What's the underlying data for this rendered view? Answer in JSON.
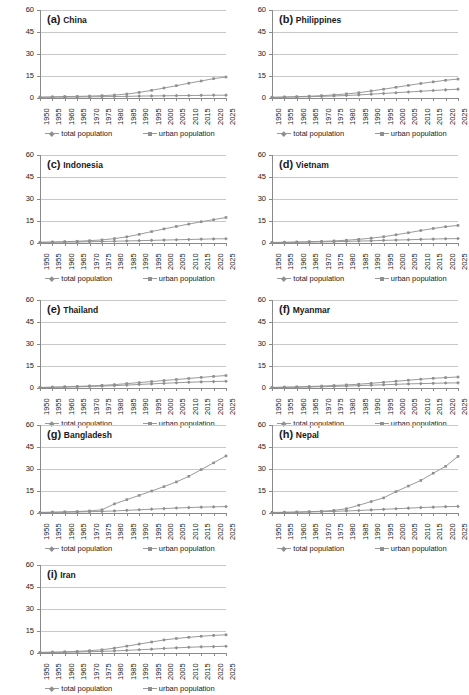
{
  "figure": {
    "panel_count": 9,
    "series_names": [
      "total population",
      "urban population"
    ],
    "legend": {
      "total_label": "total population",
      "urban_label": "urban population"
    },
    "colors": {
      "total_series": "#8f8f8f",
      "urban_series": "#8f8f8f",
      "gridline": "#c8c8c8",
      "axis": "#8a8a8a",
      "background": "#ffffff",
      "text": "#1a1a1a"
    }
  },
  "chart_data": [
    {
      "type": "line",
      "panel_id": "(a)",
      "title": "China",
      "x": [
        1950,
        1955,
        1960,
        1965,
        1970,
        1975,
        1980,
        1985,
        1990,
        1995,
        2000,
        2005,
        2010,
        2015,
        2020,
        2025
      ],
      "xlabel": "",
      "ylabel": "",
      "ylim": [
        0,
        60
      ],
      "yticks": [
        0,
        15,
        30,
        45,
        60
      ],
      "grid": true,
      "legend_position": "bottom",
      "series": [
        {
          "name": "total population",
          "values": [
            0.4,
            0.5,
            0.6,
            0.7,
            0.8,
            0.9,
            1.0,
            1.1,
            1.3,
            1.4,
            1.5,
            1.6,
            1.7,
            1.8,
            1.9,
            1.9
          ]
        },
        {
          "name": "urban population",
          "values": [
            0.6,
            0.8,
            1.0,
            1.1,
            1.3,
            1.6,
            2.0,
            2.7,
            3.8,
            5.2,
            6.8,
            8.4,
            10.1,
            11.6,
            13.2,
            14.3
          ]
        }
      ]
    },
    {
      "type": "line",
      "panel_id": "(b)",
      "title": "Philippines",
      "x": [
        1950,
        1955,
        1960,
        1965,
        1970,
        1975,
        1980,
        1985,
        1990,
        1995,
        2000,
        2005,
        2010,
        2015,
        2020,
        2025
      ],
      "xlabel": "",
      "ylabel": "",
      "ylim": [
        0,
        60
      ],
      "yticks": [
        0,
        15,
        30,
        45,
        60
      ],
      "grid": true,
      "legend_position": "bottom",
      "series": [
        {
          "name": "total population",
          "values": [
            0.4,
            0.5,
            0.7,
            0.9,
            1.1,
            1.4,
            1.7,
            2.1,
            2.6,
            3.1,
            3.6,
            4.1,
            4.6,
            5.1,
            5.6,
            6.0
          ]
        },
        {
          "name": "urban population",
          "values": [
            0.5,
            0.7,
            0.9,
            1.2,
            1.6,
            2.1,
            2.8,
            3.6,
            4.8,
            6.0,
            7.3,
            8.6,
            9.9,
            11.0,
            12.1,
            12.9
          ]
        }
      ]
    },
    {
      "type": "line",
      "panel_id": "(c)",
      "title": "Indonesia",
      "x": [
        1950,
        1955,
        1960,
        1965,
        1970,
        1975,
        1980,
        1985,
        1990,
        1995,
        2000,
        2005,
        2010,
        2015,
        2020,
        2025
      ],
      "xlabel": "",
      "ylabel": "",
      "ylim": [
        0,
        60
      ],
      "yticks": [
        0,
        15,
        30,
        45,
        60
      ],
      "grid": true,
      "legend_position": "bottom",
      "series": [
        {
          "name": "total population",
          "values": [
            0.4,
            0.5,
            0.6,
            0.7,
            0.9,
            1.0,
            1.2,
            1.4,
            1.6,
            1.8,
            2.0,
            2.2,
            2.4,
            2.6,
            2.8,
            2.9
          ]
        },
        {
          "name": "urban population",
          "values": [
            0.5,
            0.7,
            0.9,
            1.2,
            1.6,
            2.1,
            3.0,
            4.2,
            5.9,
            7.8,
            9.6,
            11.3,
            12.9,
            14.5,
            15.9,
            17.4
          ]
        }
      ]
    },
    {
      "type": "line",
      "panel_id": "(d)",
      "title": "Vietnam",
      "x": [
        1950,
        1955,
        1960,
        1965,
        1970,
        1975,
        1980,
        1985,
        1990,
        1995,
        2000,
        2005,
        2010,
        2015,
        2020,
        2025
      ],
      "xlabel": "",
      "ylabel": "",
      "ylim": [
        0,
        60
      ],
      "yticks": [
        0,
        15,
        30,
        45,
        60
      ],
      "grid": true,
      "legend_position": "bottom",
      "series": [
        {
          "name": "total population",
          "values": [
            0.3,
            0.4,
            0.5,
            0.6,
            0.8,
            0.9,
            1.1,
            1.3,
            1.5,
            1.8,
            2.0,
            2.2,
            2.5,
            2.7,
            2.9,
            3.0
          ]
        },
        {
          "name": "urban population",
          "values": [
            0.4,
            0.5,
            0.7,
            0.9,
            1.1,
            1.4,
            1.9,
            2.5,
            3.3,
            4.3,
            5.6,
            7.0,
            8.5,
            9.9,
            11.1,
            12.0
          ]
        }
      ]
    },
    {
      "type": "line",
      "panel_id": "(e)",
      "title": "Thailand",
      "x": [
        1950,
        1955,
        1960,
        1965,
        1970,
        1975,
        1980,
        1985,
        1990,
        1995,
        2000,
        2005,
        2010,
        2015,
        2020,
        2025
      ],
      "xlabel": "",
      "ylabel": "",
      "ylim": [
        0,
        60
      ],
      "yticks": [
        0,
        15,
        30,
        45,
        60
      ],
      "grid": true,
      "legend_position": "bottom",
      "series": [
        {
          "name": "total population",
          "values": [
            0.3,
            0.4,
            0.6,
            0.8,
            1.0,
            1.3,
            1.6,
            2.0,
            2.4,
            2.8,
            3.2,
            3.6,
            3.9,
            4.2,
            4.4,
            4.6
          ]
        },
        {
          "name": "urban population",
          "values": [
            0.4,
            0.6,
            0.8,
            1.1,
            1.4,
            1.8,
            2.3,
            3.0,
            3.7,
            4.4,
            5.1,
            5.8,
            6.5,
            7.2,
            7.9,
            8.5
          ]
        }
      ]
    },
    {
      "type": "line",
      "panel_id": "(f)",
      "title": "Myanmar",
      "x": [
        1950,
        1955,
        1960,
        1965,
        1970,
        1975,
        1980,
        1985,
        1990,
        1995,
        2000,
        2005,
        2010,
        2015,
        2020,
        2025
      ],
      "xlabel": "",
      "ylabel": "",
      "ylim": [
        0,
        60
      ],
      "yticks": [
        0,
        15,
        30,
        45,
        60
      ],
      "grid": true,
      "legend_position": "bottom",
      "series": [
        {
          "name": "total population",
          "values": [
            0.3,
            0.4,
            0.5,
            0.7,
            0.9,
            1.1,
            1.3,
            1.6,
            1.9,
            2.2,
            2.5,
            2.8,
            3.0,
            3.2,
            3.4,
            3.5
          ]
        },
        {
          "name": "urban population",
          "values": [
            0.4,
            0.6,
            0.8,
            1.0,
            1.3,
            1.7,
            2.1,
            2.6,
            3.2,
            3.9,
            4.6,
            5.3,
            6.0,
            6.6,
            7.1,
            7.5
          ]
        }
      ]
    },
    {
      "type": "line",
      "panel_id": "(g)",
      "title": "Bangladesh",
      "x": [
        1950,
        1955,
        1960,
        1965,
        1970,
        1975,
        1980,
        1985,
        1990,
        1995,
        2000,
        2005,
        2010,
        2015,
        2020,
        2025
      ],
      "xlabel": "",
      "ylabel": "",
      "ylim": [
        0,
        60
      ],
      "yticks": [
        0,
        15,
        30,
        45,
        60
      ],
      "grid": true,
      "legend_position": "bottom",
      "series": [
        {
          "name": "total population",
          "values": [
            0.3,
            0.4,
            0.5,
            0.7,
            0.9,
            1.1,
            1.4,
            1.8,
            2.2,
            2.6,
            3.0,
            3.4,
            3.7,
            4.0,
            4.2,
            4.4
          ]
        },
        {
          "name": "urban population",
          "values": [
            0.4,
            0.6,
            0.8,
            1.0,
            1.4,
            2.2,
            6.2,
            9.1,
            12.0,
            15.0,
            18.0,
            21.2,
            25.0,
            29.6,
            34.2,
            38.9
          ]
        }
      ]
    },
    {
      "type": "line",
      "panel_id": "(h)",
      "title": "Nepal",
      "x": [
        1950,
        1955,
        1960,
        1965,
        1970,
        1975,
        1980,
        1985,
        1990,
        1995,
        2000,
        2005,
        2010,
        2015,
        2020,
        2025
      ],
      "xlabel": "",
      "ylabel": "",
      "ylim": [
        0,
        60
      ],
      "yticks": [
        0,
        15,
        30,
        45,
        60
      ],
      "grid": true,
      "legend_position": "bottom",
      "series": [
        {
          "name": "total population",
          "values": [
            0.3,
            0.4,
            0.5,
            0.7,
            0.9,
            1.1,
            1.4,
            1.7,
            2.1,
            2.5,
            2.9,
            3.3,
            3.7,
            4.0,
            4.3,
            4.5
          ]
        },
        {
          "name": "urban population",
          "values": [
            0.4,
            0.5,
            0.7,
            0.9,
            1.2,
            1.8,
            2.9,
            5.3,
            7.8,
            10.3,
            14.6,
            18.4,
            22.2,
            27.1,
            31.8,
            38.6
          ]
        }
      ]
    },
    {
      "type": "line",
      "panel_id": "(i)",
      "title": "Iran",
      "x": [
        1950,
        1955,
        1960,
        1965,
        1970,
        1975,
        1980,
        1985,
        1990,
        1995,
        2000,
        2005,
        2010,
        2015,
        2020,
        2025
      ],
      "xlabel": "",
      "ylabel": "",
      "ylim": [
        0,
        60
      ],
      "yticks": [
        0,
        15,
        30,
        45,
        60
      ],
      "grid": true,
      "legend_position": "bottom",
      "series": [
        {
          "name": "total population",
          "values": [
            0.3,
            0.4,
            0.5,
            0.7,
            0.9,
            1.1,
            1.4,
            1.8,
            2.2,
            2.6,
            3.1,
            3.5,
            3.9,
            4.2,
            4.4,
            4.6
          ]
        },
        {
          "name": "urban population",
          "values": [
            0.4,
            0.6,
            0.8,
            1.1,
            1.6,
            2.2,
            3.3,
            4.7,
            6.1,
            7.5,
            8.9,
            9.9,
            10.7,
            11.4,
            12.0,
            12.4
          ]
        }
      ]
    }
  ]
}
